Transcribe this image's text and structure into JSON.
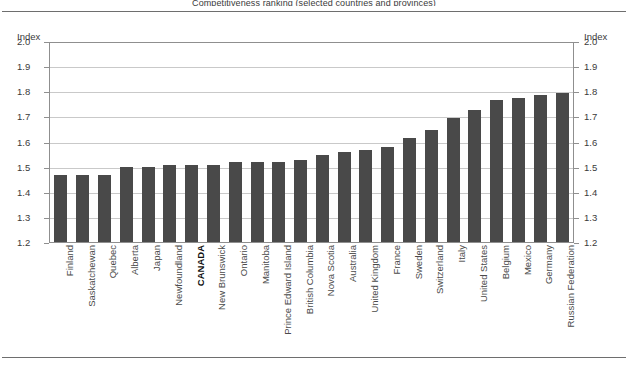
{
  "figure": {
    "title_clipped": "Competitiveness ranking (selected countries and provinces)",
    "axis_caption_left": "Index",
    "axis_caption_right": "Index"
  },
  "chart_data": {
    "type": "bar",
    "title": "",
    "xlabel": "",
    "ylabel": "Index",
    "ylim": [
      1.2,
      2.0
    ],
    "ytick_labels": [
      "2.0",
      "1.9",
      "1.8",
      "1.7",
      "1.6",
      "1.5",
      "1.4",
      "1.3",
      "1.2"
    ],
    "yticks": [
      2.0,
      1.9,
      1.8,
      1.7,
      1.6,
      1.5,
      1.4,
      1.3,
      1.2
    ],
    "grid": true,
    "legend": "none",
    "bar_color": "#494949",
    "highlight_category": "CANADA",
    "categories": [
      "Finland",
      "Saskatchewan",
      "Quebec",
      "Alberta",
      "Japan",
      "Newfoundland",
      "CANADA",
      "New Brunswick",
      "Ontario",
      "Manitoba",
      "Prince Edward Island",
      "British Columbia",
      "Nova Scotia",
      "Australia",
      "United Kingdom",
      "France",
      "Sweden",
      "Switzerland",
      "Italy",
      "United States",
      "Belgium",
      "Mexico",
      "Germany",
      "Russian Federation"
    ],
    "values": [
      1.47,
      1.47,
      1.47,
      1.5,
      1.5,
      1.51,
      1.51,
      1.51,
      1.52,
      1.52,
      1.52,
      1.53,
      1.55,
      1.56,
      1.57,
      1.58,
      1.62,
      1.65,
      1.7,
      1.73,
      1.77,
      1.78,
      1.79,
      1.8
    ]
  }
}
